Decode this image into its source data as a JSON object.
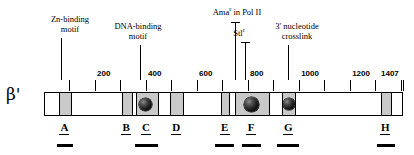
{
  "figure": {
    "subunit": "β'",
    "bar": {
      "start_residue": 1,
      "end_residue": 1407,
      "px_left": 44,
      "px_width": 359
    }
  },
  "axis": {
    "tick_interval": 100,
    "labeled_ticks": [
      {
        "value": 200,
        "label": "200"
      },
      {
        "value": 400,
        "label": "400"
      },
      {
        "value": 600,
        "label": "600"
      },
      {
        "value": 800,
        "label": "800"
      },
      {
        "value": 1000,
        "label": "1000"
      },
      {
        "value": 1200,
        "label": "1200"
      },
      {
        "value": 1407,
        "label": "1407"
      }
    ],
    "unlabeled_ticks": [
      100,
      300,
      500,
      700,
      900,
      1100,
      1300,
      1400
    ]
  },
  "callouts": [
    {
      "id": "zn-binding-motif",
      "line1": "Zn-binding",
      "line2": "motif",
      "residue": 70,
      "cap": false
    },
    {
      "id": "dna-binding-motif",
      "line1": "DNA-binding",
      "line2": "motif",
      "residue": 380,
      "cap": false
    },
    {
      "id": "amar-in-pol-ii",
      "line1": "Ama",
      "sup": "r",
      "line1_tail": " in Pol II",
      "line2": "",
      "residue": 750,
      "cap": true
    },
    {
      "id": "stlr",
      "line1": "Stl",
      "sup": "r",
      "line1_tail": "",
      "line2": "",
      "residue": 790,
      "cap": true
    },
    {
      "id": "three-prime-nucleotide-crosslink",
      "line1": "3' nucleotide",
      "line2": "crosslink",
      "residue": 960,
      "cap": false
    }
  ],
  "domains": [
    {
      "id": "block-a",
      "start": 55,
      "end": 105
    },
    {
      "id": "block-b",
      "start": 300,
      "end": 345
    },
    {
      "id": "block-c",
      "start": 355,
      "end": 445
    },
    {
      "id": "block-d",
      "start": 490,
      "end": 545
    },
    {
      "id": "block-e",
      "start": 690,
      "end": 725
    },
    {
      "id": "block-f",
      "start": 745,
      "end": 880
    },
    {
      "id": "block-g",
      "start": 930,
      "end": 985
    },
    {
      "id": "block-h",
      "start": 1315,
      "end": 1360
    }
  ],
  "spheres": [
    {
      "id": "sphere-c",
      "residue": 395,
      "diameter_px": 13
    },
    {
      "id": "sphere-f",
      "residue": 808,
      "diameter_px": 15
    },
    {
      "id": "sphere-g",
      "residue": 957,
      "diameter_px": 12
    }
  ],
  "regions": [
    {
      "id": "region-a",
      "label": "A",
      "residue": 80,
      "underbar": true,
      "underbar_start": 50,
      "underbar_end": 115
    },
    {
      "id": "region-b",
      "label": "B",
      "residue": 322,
      "underbar": false,
      "underbar_start": 0,
      "underbar_end": 0
    },
    {
      "id": "region-c",
      "label": "C",
      "residue": 400,
      "underbar": true,
      "underbar_start": 358,
      "underbar_end": 445
    },
    {
      "id": "region-d",
      "label": "D",
      "residue": 518,
      "underbar": false,
      "underbar_start": 0,
      "underbar_end": 0
    },
    {
      "id": "region-e",
      "label": "E",
      "residue": 708,
      "underbar": true,
      "underbar_start": 670,
      "underbar_end": 745
    },
    {
      "id": "region-f",
      "label": "F",
      "residue": 812,
      "underbar": true,
      "underbar_start": 775,
      "underbar_end": 850
    },
    {
      "id": "region-g",
      "label": "G",
      "residue": 957,
      "underbar": true,
      "underbar_start": 915,
      "underbar_end": 1000
    },
    {
      "id": "region-h",
      "label": "H",
      "residue": 1338,
      "underbar": true,
      "underbar_start": 1305,
      "underbar_end": 1375
    }
  ],
  "colors": {
    "stroke": "#000000",
    "domain_fill": "#c9c9c9",
    "background": "#ffffff"
  }
}
